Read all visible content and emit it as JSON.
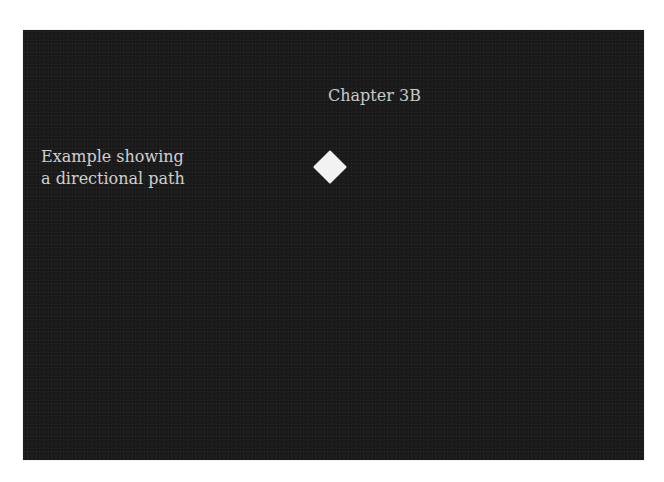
{
  "panel": {
    "background_color": "#1c1c1c",
    "chapter_title": "Chapter 3B",
    "caption_lines": [
      "Example showing",
      "a directional path"
    ],
    "marker": {
      "shape": "diamond-icon",
      "color": "#f2f2f2"
    }
  }
}
